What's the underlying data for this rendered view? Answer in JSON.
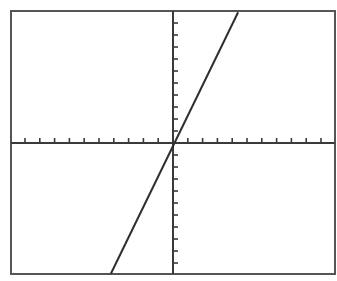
{
  "chart_data": {
    "type": "line",
    "title": "",
    "xlabel": "",
    "ylabel": "",
    "xlim": [
      -10.8,
      10.9
    ],
    "ylim": [
      -10.9,
      11.1
    ],
    "xticks_step": 1,
    "yticks_step": 1,
    "grid": false,
    "legend": null,
    "series": [
      {
        "name": "y = 2.5x",
        "equation": "y = 2.5x",
        "slope": 2.5,
        "intercept": 0,
        "x": [
          -4.2,
          4.4
        ],
        "y": [
          -10.9,
          10.9
        ]
      }
    ]
  },
  "style": {
    "axis_color": "#3a3a3a",
    "line_color": "#2e2e2e",
    "frame_color": "#555555",
    "background": "#ffffff"
  },
  "layout": {
    "frame": {
      "left": 11,
      "top": 11,
      "right": 335,
      "bottom": 274
    },
    "origin_px": {
      "x": 173,
      "y": 143
    },
    "px_per_unit": {
      "x": 14.8,
      "y": 12
    },
    "tick_count": {
      "x_neg": 10,
      "x_pos": 10,
      "y_pos": 10,
      "y_neg": 10
    }
  }
}
